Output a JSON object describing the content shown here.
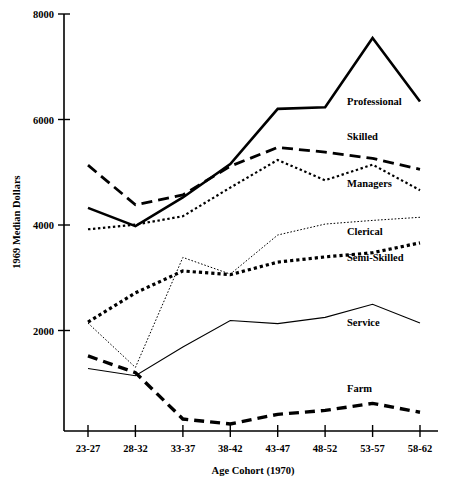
{
  "chart_data": {
    "type": "line",
    "title": "",
    "xlabel": "Age Cohort (1970)",
    "ylabel": "1969 Median Dollars",
    "categories": [
      "23-27",
      "28-32",
      "33-37",
      "38-42",
      "43-47",
      "48-52",
      "53-57",
      "58-62"
    ],
    "ylim": [
      0,
      8000
    ],
    "xlim_note": "categorical",
    "yticks": [
      0,
      2000,
      4000,
      6000,
      8000
    ],
    "ytick_labels": [
      "",
      "2000",
      "4000",
      "6000",
      "8000"
    ],
    "grid": false,
    "legend": "inline-labels",
    "series": [
      {
        "name": "Professional",
        "style": "solid-thick",
        "values": [
          4280,
          3930,
          4480,
          5120,
          6180,
          6210,
          7540,
          6320
        ],
        "label_x": "43-47",
        "label_offset": {
          "x": 347,
          "y": 105
        }
      },
      {
        "name": "Skilled",
        "style": "dashed-thick",
        "values": [
          5100,
          4340,
          4530,
          5080,
          5440,
          5350,
          5230,
          5020
        ],
        "label_offset": {
          "x": 347,
          "y": 140
        }
      },
      {
        "name": "Managers",
        "style": "dotted-medium",
        "values": [
          3870,
          3960,
          4120,
          4670,
          5200,
          4810,
          5110,
          4620
        ],
        "label_offset": {
          "x": 347,
          "y": 187
        }
      },
      {
        "name": "Clerical",
        "style": "dotted-fine",
        "values": [
          2070,
          1220,
          3330,
          3010,
          3760,
          3970,
          4040,
          4100
        ],
        "label_offset": {
          "x": 347,
          "y": 235
        }
      },
      {
        "name": "Semi-Skilled",
        "style": "dotted-bold",
        "values": [
          2090,
          2650,
          3070,
          3000,
          3240,
          3340,
          3420,
          3610
        ],
        "label_offset": {
          "x": 347,
          "y": 261
        }
      },
      {
        "name": "Service",
        "style": "solid-thin",
        "values": [
          1200,
          1060,
          1610,
          2120,
          2060,
          2180,
          2430,
          2070
        ],
        "label_offset": {
          "x": 347,
          "y": 326
        }
      },
      {
        "name": "Farm",
        "style": "dashed-bold",
        "values": [
          1440,
          1120,
          230,
          135,
          320,
          395,
          530,
          360
        ],
        "label_offset": {
          "x": 347,
          "y": 392
        }
      }
    ]
  },
  "axis": {
    "y_title": "1969 Median Dollars",
    "x_title": "Age Cohort (1970)",
    "y_labels": [
      "8000",
      "6000",
      "4000",
      "2000"
    ],
    "x_labels": [
      "23-27",
      "28-32",
      "33-37",
      "38-42",
      "43-47",
      "48-52",
      "53-57",
      "58-62"
    ]
  },
  "series_labels": {
    "professional": "Professional",
    "skilled": "Skilled",
    "managers": "Managers",
    "clerical": "Clerical",
    "semi_skilled": "Semi-Skilled",
    "service": "Service",
    "farm": "Farm"
  },
  "colors": {
    "ink": "#000000",
    "background": "#ffffff"
  }
}
